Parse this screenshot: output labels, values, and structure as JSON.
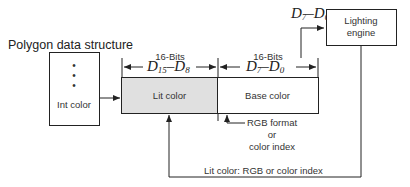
{
  "diagram": {
    "title": "Polygon data structure",
    "int_box": {
      "label": "Int color",
      "dots": [
        "•",
        "•",
        "•"
      ]
    },
    "lit_field": {
      "label": "Lit color",
      "bits": "16-Bits",
      "range_hi": "D",
      "range_hi_sub": "15",
      "range_sep": "–",
      "range_lo": "D",
      "range_lo_sub": "8",
      "fill": "#e0e0e0"
    },
    "base_field": {
      "label": "Base color",
      "bits": "16-Bits",
      "range_hi": "D",
      "range_hi_sub": "7",
      "range_sep": "–",
      "range_lo": "D",
      "range_lo_sub": "0",
      "fill": "#ffffff"
    },
    "engine_input": {
      "range_hi": "D",
      "range_hi_sub": "7",
      "range_sep": "–",
      "range_lo": "D",
      "range_lo_sub": "0"
    },
    "engine_box": {
      "line1": "Lighting",
      "line2": "engine"
    },
    "base_note": {
      "line1": "RGB format",
      "line2": "or",
      "line3": "color index"
    },
    "feedback_label": "Lit color: RGB or color index",
    "colors": {
      "stroke": "#222222",
      "lit_fill": "#e0e0e0"
    }
  }
}
